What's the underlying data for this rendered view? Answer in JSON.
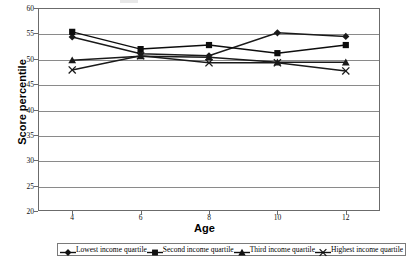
{
  "chart_data": {
    "type": "line",
    "title": "",
    "xlabel": "Age",
    "ylabel": "Score percentile",
    "x": [
      4,
      6,
      8,
      10,
      12
    ],
    "xtick_labels": [
      "4",
      "6",
      "8",
      "10",
      "12"
    ],
    "ytick_labels": [
      "20",
      "25",
      "30",
      "35",
      "40",
      "45",
      "50",
      "55",
      "60"
    ],
    "ytick_values": [
      20,
      25,
      30,
      35,
      40,
      45,
      50,
      55,
      60
    ],
    "ylim": [
      20,
      60
    ],
    "xlim": [
      3,
      13
    ],
    "grid": "horizontal",
    "legend_position": "bottom",
    "series": [
      {
        "name": "Lowest income quartile",
        "marker": "diamond",
        "color": "#1a1a1a",
        "values": [
          54.3,
          51.0,
          50.6,
          55.1,
          54.4
        ]
      },
      {
        "name": "Second income quartile",
        "marker": "square",
        "color": "#0d0d0d",
        "values": [
          55.3,
          51.9,
          52.7,
          51.1,
          52.7
        ]
      },
      {
        "name": "Third income quartile",
        "marker": "triangle",
        "color": "#1a1a1a",
        "values": [
          49.7,
          50.5,
          50.3,
          49.3,
          49.3
        ]
      },
      {
        "name": "Highest income quartile",
        "marker": "x",
        "color": "#1a1a1a",
        "values": [
          47.8,
          50.6,
          49.2,
          49.2,
          47.6
        ]
      }
    ]
  },
  "legend": {
    "entries": [
      {
        "label": "Lowest income quartile",
        "marker": "diamond"
      },
      {
        "label": "Second income quartile",
        "marker": "square"
      },
      {
        "label": "Third income quartile",
        "marker": "triangle"
      },
      {
        "label": "Highest income quartile",
        "marker": "x"
      }
    ]
  },
  "axes": {
    "y_title": "Score percentile",
    "x_title": "Age"
  }
}
